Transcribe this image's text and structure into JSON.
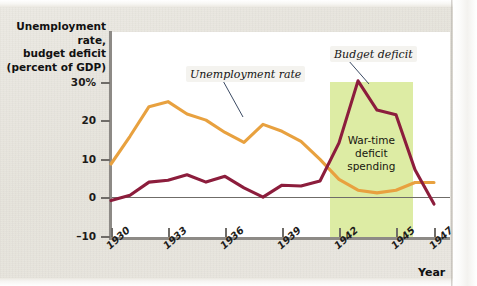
{
  "chart_data": {
    "type": "line",
    "title": "",
    "ylabel_lines": [
      "Unemployment rate,",
      "budget deficit",
      "(percent of GDP)"
    ],
    "xlabel": "Year",
    "ylim": [
      -10,
      32
    ],
    "xlim": [
      1930,
      1948
    ],
    "grid": false,
    "legend_position": "inline-callouts",
    "ytick_labels": [
      "30%",
      "20",
      "10",
      "0",
      "–10"
    ],
    "ytick_values": [
      30,
      20,
      10,
      0,
      -10
    ],
    "xtick_labels": [
      "1930",
      "1933",
      "1936",
      "1939",
      "1942",
      "1945",
      "1947"
    ],
    "xtick_values": [
      1930,
      1933,
      1936,
      1939,
      1942,
      1945,
      1947
    ],
    "x": [
      1930,
      1931,
      1932,
      1933,
      1934,
      1935,
      1936,
      1937,
      1938,
      1939,
      1940,
      1941,
      1942,
      1943,
      1944,
      1945,
      1946,
      1947
    ],
    "series": [
      {
        "name": "Unemployment rate",
        "color": "#e8a13f",
        "values": [
          8.7,
          15.9,
          23.6,
          24.9,
          21.7,
          20.1,
          16.9,
          14.3,
          19.0,
          17.2,
          14.6,
          9.9,
          4.7,
          1.9,
          1.2,
          1.9,
          3.9,
          3.9
        ]
      },
      {
        "name": "Budget deficit",
        "color": "#8c1d3c",
        "values": [
          -0.8,
          0.6,
          4.0,
          4.5,
          5.9,
          4.0,
          5.5,
          2.5,
          0.1,
          3.2,
          3.0,
          4.3,
          14.2,
          30.3,
          22.7,
          21.5,
          7.2,
          -1.7
        ]
      }
    ],
    "shaded_region": {
      "label_lines": [
        "War-time",
        "deficit",
        "spending"
      ],
      "x_start": 1941.5,
      "x_end": 1945.9,
      "color": "#ddeca4"
    },
    "annotations": [
      {
        "name": "unemployment-callout",
        "text": "Unemployment rate",
        "points_to_year": 1936.2
      },
      {
        "name": "budget-deficit-callout",
        "text": "Budget deficit",
        "points_to_year": 1943.2
      }
    ]
  },
  "axis": {
    "y_title": "Unemployment rate,\nbudget deficit\n(percent of GDP)",
    "y_title_line1": "Unemployment rate,",
    "y_title_line2": "budget deficit",
    "y_title_line3": "(percent of GDP)",
    "x_title": "Year"
  },
  "yticks": [
    {
      "label": "30%",
      "value": 30
    },
    {
      "label": "20",
      "value": 20
    },
    {
      "label": "10",
      "value": 10
    },
    {
      "label": "0",
      "value": 0
    },
    {
      "label": "–10",
      "value": -10
    }
  ],
  "xticks": [
    {
      "label": "1930"
    },
    {
      "label": "1933"
    },
    {
      "label": "1936"
    },
    {
      "label": "1939"
    },
    {
      "label": "1942"
    },
    {
      "label": "1945"
    },
    {
      "label": "1947"
    }
  ],
  "callouts": {
    "unemployment": "Unemployment rate",
    "budget_deficit": "Budget deficit"
  },
  "shaded": {
    "line1": "War-time",
    "line2": "deficit",
    "line3": "spending"
  },
  "colors": {
    "unemployment_line": "#e8a13f",
    "deficit_line": "#8c1d3c",
    "war_band": "#ddeca4",
    "axis": "#8d8a86",
    "page_background": "#e9e6df",
    "plot_background": "#ffffff"
  }
}
